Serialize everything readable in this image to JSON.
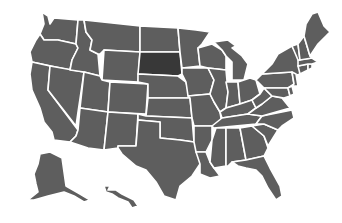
{
  "map": {
    "title": "United States map",
    "colors": {
      "background": "#ffffff",
      "default_fill": "#5e5e5e",
      "highlight_fill": "#383838",
      "border": "#ffffff"
    },
    "highlighted_state": "SD",
    "states": [
      {
        "id": "WA",
        "name": "Washington",
        "points": "42,12 48,16 50,24 54,18 78,20 76,44 58,40 44,40 40,34 44,24"
      },
      {
        "id": "OR",
        "name": "Oregon",
        "points": "40,34 44,40 58,40 76,44 78,48 72,60 70,70 32,62 30,52 36,40"
      },
      {
        "id": "CA",
        "name": "California",
        "points": "32,62 50,66 48,90 78,130 76,136 70,142 54,140 52,132 44,122 40,108 32,90 30,74"
      },
      {
        "id": "NV",
        "name": "Nevada",
        "points": "50,66 84,72 78,112 76,126 48,90"
      },
      {
        "id": "ID",
        "name": "Idaho",
        "points": "78,20 84,20 86,32 92,40 90,50 98,54 100,76 84,72 70,70 72,60 78,48 76,44"
      },
      {
        "id": "MT",
        "name": "Montana",
        "points": "84,20 140,26 140,52 104,50 100,54 98,54 90,50 92,40 86,32"
      },
      {
        "id": "WY",
        "name": "Wyoming",
        "points": "104,50 140,52 138,82 102,80"
      },
      {
        "id": "UT",
        "name": "Utah",
        "points": "84,72 100,76 102,80 110,82 108,112 80,108"
      },
      {
        "id": "AZ",
        "name": "Arizona",
        "points": "80,108 108,112 104,150 88,148 70,142 76,136 78,130"
      },
      {
        "id": "CO",
        "name": "Colorado",
        "points": "110,82 148,84 146,114 108,112"
      },
      {
        "id": "NM",
        "name": "New Mexico",
        "points": "108,112 138,114 136,146 118,146 118,148 104,150"
      },
      {
        "id": "ND",
        "name": "North Dakota",
        "points": "140,26 178,28 180,52 140,52"
      },
      {
        "id": "SD",
        "name": "South Dakota",
        "points": "140,52 180,52 182,74 178,76 138,74"
      },
      {
        "id": "NE",
        "name": "Nebraska",
        "points": "138,74 178,76 186,82 190,98 148,98 148,84 138,82"
      },
      {
        "id": "KS",
        "name": "Kansas",
        "points": "148,98 190,98 192,118 146,116"
      },
      {
        "id": "OK",
        "name": "Oklahoma",
        "points": "138,114 146,116 192,118 194,142 180,140 160,138 160,122 138,120"
      },
      {
        "id": "TX",
        "name": "Texas",
        "points": "138,120 160,122 160,138 180,140 194,142 200,146 200,164 192,176 180,186 176,200 164,196 156,182 146,170 136,166 122,154 118,148 118,146 136,146"
      },
      {
        "id": "MN",
        "name": "Minnesota",
        "points": "178,28 196,30 210,32 202,44 198,48 200,66 182,68 180,52"
      },
      {
        "id": "IA",
        "name": "Iowa",
        "points": "182,68 208,68 214,80 210,94 188,96 186,82 182,74"
      },
      {
        "id": "MO",
        "name": "Missouri",
        "points": "188,96 210,94 214,102 220,112 222,124 212,126 194,126 192,118 190,98"
      },
      {
        "id": "AR",
        "name": "Arkansas",
        "points": "194,126 212,126 212,140 206,152 196,152 194,142"
      },
      {
        "id": "LA",
        "name": "Louisiana",
        "points": "196,152 206,152 210,162 214,168 220,176 210,178 200,174 200,164"
      },
      {
        "id": "WI",
        "name": "Wisconsin",
        "points": "198,48 212,44 222,50 226,56 226,70 208,68 200,66"
      },
      {
        "id": "IL",
        "name": "Illinois",
        "points": "208,68 226,70 228,92 226,108 220,112 214,102 210,94 214,80"
      },
      {
        "id": "MI",
        "name": "Michigan",
        "points": "214,42 228,40 236,46 232,48 242,56 248,64 244,80 232,80 232,62 226,56 222,50"
      },
      {
        "id": "IN",
        "name": "Indiana",
        "points": "226,82 238,82 240,104 226,108 228,92"
      },
      {
        "id": "OH",
        "name": "Ohio",
        "points": "238,82 250,78 256,80 260,94 252,100 240,104"
      },
      {
        "id": "KY",
        "name": "Kentucky",
        "points": "220,112 226,108 240,104 252,100 256,108 248,114 222,118"
      },
      {
        "id": "TN",
        "name": "Tennessee",
        "points": "212,126 222,118 248,114 262,116 256,124 214,128"
      },
      {
        "id": "MS",
        "name": "Mississippi",
        "points": "212,140 216,128 226,128 226,166 214,168 210,162"
      },
      {
        "id": "AL",
        "name": "Alabama",
        "points": "226,128 240,128 246,160 232,162 228,166 226,166"
      },
      {
        "id": "GA",
        "name": "Georgia",
        "points": "240,128 252,126 264,136 268,148 264,156 246,160"
      },
      {
        "id": "FL",
        "name": "Florida",
        "points": "232,162 246,160 264,156 270,168 280,186 282,196 276,200 268,188 262,176 256,170 246,168 238,166"
      },
      {
        "id": "SC",
        "name": "South Carolina",
        "points": "252,126 264,124 278,130 268,146 264,136"
      },
      {
        "id": "NC",
        "name": "North Carolina",
        "points": "256,124 262,116 292,110 294,118 282,126 278,130 264,124"
      },
      {
        "id": "VA",
        "name": "Virginia",
        "points": "248,114 256,108 262,104 272,96 282,98 290,108 262,116"
      },
      {
        "id": "WV",
        "name": "West Virginia",
        "points": "252,100 260,94 264,88 270,94 272,96 262,104 256,108"
      },
      {
        "id": "PA",
        "name": "Pennsylvania",
        "points": "256,80 262,74 292,72 294,84 288,88 264,88"
      },
      {
        "id": "NY",
        "name": "New York",
        "points": "262,74 272,64 278,54 292,46 300,60 300,74 294,76 292,72"
      },
      {
        "id": "MD",
        "name": "Maryland",
        "points": "264,88 288,88 290,96 284,98 272,96 270,94"
      },
      {
        "id": "DE",
        "name": "Delaware",
        "points": "288,88 292,86 294,94 290,96"
      },
      {
        "id": "NJ",
        "name": "New Jersey",
        "points": "292,72 296,74 298,86 292,86 294,84"
      },
      {
        "id": "CT",
        "name": "Connecticut",
        "points": "298,66 308,64 308,70 300,74"
      },
      {
        "id": "RI",
        "name": "Rhode Island",
        "points": "308,64 312,64 312,68 308,70"
      },
      {
        "id": "MA",
        "name": "Massachusetts",
        "points": "298,60 312,58 318,62 312,64 308,64 298,66"
      },
      {
        "id": "VT",
        "name": "Vermont",
        "points": "292,46 298,44 300,60 298,60"
      },
      {
        "id": "NH",
        "name": "New Hampshire",
        "points": "298,44 304,36 310,56 312,58 300,60"
      },
      {
        "id": "ME",
        "name": "Maine",
        "points": "304,36 306,24 312,14 318,12 324,26 330,32 318,44 310,56"
      },
      {
        "id": "AK",
        "name": "Alaska",
        "points": "40,154 50,152 62,158 66,186 80,194 90,200 84,202 74,196 64,192 48,196 34,200 28,200 38,192 36,184 34,174 38,164"
      },
      {
        "id": "HI",
        "name": "Hawaii",
        "points": "104,186 110,186 108,190 116,190 122,194 126,196 134,200 138,206 132,208 128,202 118,198 112,194 106,192"
      }
    ]
  }
}
